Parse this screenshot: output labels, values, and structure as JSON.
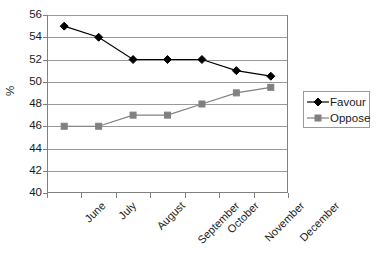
{
  "chart_data": {
    "type": "line",
    "title": "",
    "xlabel": "",
    "ylabel": "%",
    "categories": [
      "June",
      "July",
      "August",
      "September",
      "October",
      "November",
      "December"
    ],
    "series": [
      {
        "name": "Favour",
        "values": [
          55,
          54,
          52,
          52,
          52,
          51,
          50.5
        ],
        "color": "#000000",
        "marker": "diamond"
      },
      {
        "name": "Oppose",
        "values": [
          46,
          46,
          47,
          47,
          48,
          49,
          49.5
        ],
        "color": "#808080",
        "marker": "square"
      }
    ],
    "ylim": [
      40,
      56
    ],
    "ytick_step": 2,
    "yticks": [
      40,
      42,
      44,
      46,
      48,
      50,
      52,
      54,
      56
    ],
    "grid": "horizontal",
    "legend_position": "right",
    "legend_entries": [
      "Favour",
      "Oppose"
    ]
  },
  "style": {
    "grid_color": "#9a9a9a",
    "axis_color": "#808080",
    "text_color": "#1a1a1a",
    "background": "#ffffff"
  }
}
